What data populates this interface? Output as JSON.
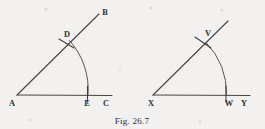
{
  "figure": {
    "caption": "Fig. 26.7",
    "background_color": "#f2f1ef",
    "ink_color": "#4a4744",
    "diagrams": [
      {
        "name": "original-angle-bac",
        "description": "Angle BAC with arc DE drawn from vertex A",
        "vertex_label": "A",
        "points": [
          {
            "id": "A",
            "label": "A",
            "role": "vertex",
            "x": 17,
            "y": 95
          },
          {
            "id": "B",
            "label": "B",
            "role": "ray-endpoint",
            "x": 102,
            "y": 12
          },
          {
            "id": "C",
            "label": "C",
            "role": "ray-endpoint",
            "x": 106,
            "y": 96
          },
          {
            "id": "D",
            "label": "D",
            "role": "arc-intersection-on-ray",
            "x": 68,
            "y": 42
          },
          {
            "id": "E",
            "label": "E",
            "role": "arc-intersection-on-base",
            "x": 87,
            "y": 95
          }
        ],
        "arc": {
          "center": "A",
          "radius": 73,
          "from": "D",
          "to": "E"
        }
      },
      {
        "name": "copied-angle-yxv",
        "description": "Copied angle at vertex X with arc VW",
        "vertex_label": "X",
        "points": [
          {
            "id": "X",
            "label": "X",
            "role": "vertex",
            "x": 153,
            "y": 95
          },
          {
            "id": "V",
            "label": "V",
            "role": "arc-intersection-on-ray",
            "x": 207,
            "y": 43
          },
          {
            "id": "W",
            "label": "W",
            "role": "arc-intersection-on-base",
            "x": 226,
            "y": 95
          },
          {
            "id": "Y",
            "label": "Y",
            "role": "ray-endpoint",
            "x": 243,
            "y": 96
          }
        ],
        "arc": {
          "center": "X",
          "radius": 73,
          "from": "V",
          "to": "W"
        }
      }
    ]
  }
}
